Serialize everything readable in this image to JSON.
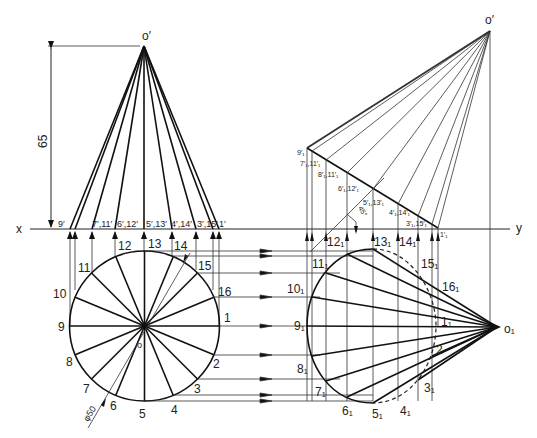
{
  "figure": {
    "axis": {
      "x_label": "x",
      "y_label": "y"
    },
    "dimensions": {
      "height": "65",
      "diameter": "φ50",
      "angle": "45°"
    },
    "front_view": {
      "apex_label": "o′",
      "base_labels": [
        "9′",
        "7′,11′",
        "6′,12′",
        "5′,13′",
        "4′,14′",
        "3′,15′",
        "1′"
      ]
    },
    "top_view": {
      "center_label": "o",
      "points": [
        "1",
        "2",
        "3",
        "4",
        "5",
        "6",
        "7",
        "8",
        "9",
        "10",
        "11",
        "12",
        "13",
        "14",
        "15",
        "16"
      ]
    },
    "aux_front_view": {
      "apex_label": "o′",
      "labels": [
        "9′₁",
        "7′₁,11′₁",
        "8′₁,11′₁",
        "6′₁,12′₁",
        "5′₁,13′₁",
        "4′₁,14′₁",
        "3′₁,15′₁",
        "1′₁"
      ]
    },
    "aux_top_view": {
      "apex_label": "o₁",
      "points": [
        "1₁",
        "2",
        "3₁",
        "4₁",
        "5₁",
        "6₁",
        "7₁",
        "8₁",
        "9₁",
        "10₁",
        "11₁",
        "12₁",
        "13₁",
        "14₁",
        "15₁",
        "16₁"
      ]
    }
  }
}
